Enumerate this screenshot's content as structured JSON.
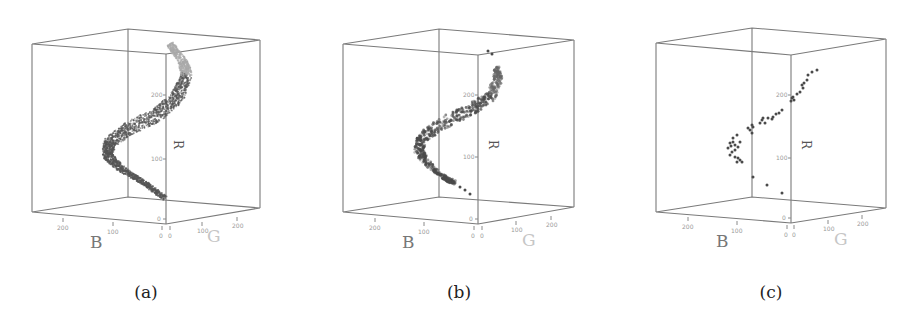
{
  "figure": {
    "captions": [
      "(a)",
      "(b)",
      "(c)"
    ]
  },
  "axes": {
    "x_label": "B",
    "y_label": "G",
    "z_label": "R",
    "b_ticks": [
      "200",
      "100",
      "0"
    ],
    "g_ticks": [
      "0",
      "100",
      "200"
    ],
    "r_ticks": [
      "0",
      "100",
      "200"
    ]
  },
  "colors": {
    "box": "#7a7a7a",
    "points_dense": "#555555",
    "points_light": "#aaaaaa",
    "points": "#4a4a4a"
  },
  "chart_data": [
    {
      "type": "scatter",
      "title": "(a)",
      "projection": "3d",
      "xlabel": "B",
      "ylabel": "G",
      "zlabel": "R",
      "xlim": [
        0,
        255
      ],
      "ylim": [
        0,
        255
      ],
      "zlim": [
        0,
        255
      ],
      "description": "Dense point cloud forming an S-shaped curved band through RGB space",
      "grid": false,
      "series": [
        {
          "name": "all pixels",
          "density": "very dense",
          "path_screen_px": [
            [
              170,
              44
            ],
            [
              183,
              62
            ],
            [
              187,
              75
            ],
            [
              177,
              98
            ],
            [
              157,
              115
            ],
            [
              130,
              128
            ],
            [
              110,
              142
            ],
            [
              107,
              155
            ],
            [
              120,
              168
            ],
            [
              143,
              182
            ],
            [
              165,
              198
            ]
          ]
        }
      ]
    },
    {
      "type": "scatter",
      "title": "(b)",
      "projection": "3d",
      "xlabel": "B",
      "ylabel": "G",
      "zlabel": "R",
      "xlim": [
        0,
        255
      ],
      "ylim": [
        0,
        255
      ],
      "zlim": [
        0,
        255
      ],
      "description": "Subsampled points along the same S-shaped curve",
      "grid": false,
      "series": [
        {
          "name": "sampled pixels",
          "density": "medium",
          "path_screen_px": [
            [
              488,
              51
            ],
            [
              492,
              54
            ],
            [
              497,
              67
            ],
            [
              498,
              80
            ],
            [
              490,
              97
            ],
            [
              470,
              110
            ],
            [
              443,
              123
            ],
            [
              423,
              137
            ],
            [
              418,
              150
            ],
            [
              427,
              163
            ],
            [
              443,
              177
            ],
            [
              455,
              183
            ],
            [
              460,
              187
            ],
            [
              465,
              190
            ],
            [
              470,
              194
            ]
          ]
        }
      ]
    },
    {
      "type": "scatter",
      "title": "(c)",
      "projection": "3d",
      "xlabel": "B",
      "ylabel": "G",
      "zlabel": "R",
      "xlim": [
        0,
        255
      ],
      "ylim": [
        0,
        255
      ],
      "zlim": [
        0,
        255
      ],
      "description": "Sparse representative points along the curve",
      "grid": false,
      "series": [
        {
          "name": "representative colors",
          "density": "sparse",
          "points_screen_px": [
            [
              817,
              70
            ],
            [
              812,
              72
            ],
            [
              808,
              75
            ],
            [
              807,
              80
            ],
            [
              804,
              83
            ],
            [
              802,
              85
            ],
            [
              803,
              88
            ],
            [
              800,
              92
            ],
            [
              797,
              94
            ],
            [
              793,
              97
            ],
            [
              792,
              98
            ],
            [
              794,
              100
            ],
            [
              791,
              101
            ],
            [
              782,
              110
            ],
            [
              779,
              113
            ],
            [
              776,
              114
            ],
            [
              773,
              117
            ],
            [
              772,
              119
            ],
            [
              768,
              118
            ],
            [
              763,
              118
            ],
            [
              762,
              120
            ],
            [
              760,
              123
            ],
            [
              765,
              123
            ],
            [
              753,
              127
            ],
            [
              752,
              125
            ],
            [
              750,
              130
            ],
            [
              752,
              133
            ],
            [
              748,
              128
            ],
            [
              737,
              135
            ],
            [
              733,
              138
            ],
            [
              730,
              143
            ],
            [
              728,
              148
            ],
            [
              732,
              152
            ],
            [
              730,
              155
            ],
            [
              735,
              157
            ],
            [
              737,
              162
            ],
            [
              740,
              160
            ],
            [
              738,
              147
            ],
            [
              735,
              145
            ],
            [
              733,
              142
            ],
            [
              740,
              142
            ],
            [
              742,
              162
            ],
            [
              738,
              158
            ],
            [
              735,
              150
            ],
            [
              731,
              146
            ],
            [
              753,
              177
            ],
            [
              767,
              185
            ],
            [
              782,
              193
            ]
          ]
        }
      ]
    }
  ]
}
